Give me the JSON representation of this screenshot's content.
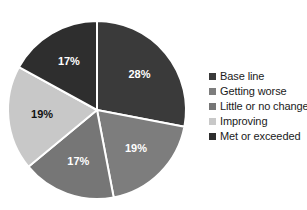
{
  "chart_data": {
    "type": "pie",
    "title": "",
    "subtitle": "",
    "xlabel": "",
    "ylabel": "",
    "legend_position": "right",
    "grid": false,
    "start_angle_deg": 0,
    "direction": "clockwise",
    "categories": [
      "Base line",
      "Getting worse",
      "Little or no change",
      "Improving",
      "Met or exceeded"
    ],
    "values": [
      28,
      19,
      17,
      19,
      17
    ],
    "labels": [
      "28%",
      "19%",
      "17%",
      "19%",
      "17%"
    ],
    "colors": [
      "#3a3a3a",
      "#7d7d7d",
      "#767676",
      "#c8c8c8",
      "#2e2e2e"
    ],
    "label_colors": [
      "#ffffff",
      "#ffffff",
      "#ffffff",
      "#111111",
      "#ffffff"
    ],
    "slices": [
      {
        "name": "Base line",
        "value": 28,
        "label": "28%",
        "color": "#3a3a3a",
        "label_color": "#ffffff"
      },
      {
        "name": "Getting worse",
        "value": 19,
        "label": "19%",
        "color": "#7d7d7d",
        "label_color": "#ffffff"
      },
      {
        "name": "Little or no change",
        "value": 17,
        "label": "17%",
        "color": "#767676",
        "label_color": "#ffffff"
      },
      {
        "name": "Improving",
        "value": 19,
        "label": "19%",
        "color": "#c8c8c8",
        "label_color": "#111111"
      },
      {
        "name": "Met or exceeded",
        "value": 17,
        "label": "17%",
        "color": "#2e2e2e",
        "label_color": "#ffffff"
      }
    ]
  },
  "geometry": {
    "center_x": 97,
    "center_y": 110,
    "radius": 89,
    "separator_color": "#ffffff",
    "separator_width": 2
  },
  "legend": {
    "items": [
      {
        "label": "Base line",
        "color": "#3a3a3a"
      },
      {
        "label": "Getting worse",
        "color": "#7d7d7d"
      },
      {
        "label": "Little or no change",
        "color": "#767676"
      },
      {
        "label": "Improving",
        "color": "#c8c8c8"
      },
      {
        "label": "Met or exceeded",
        "color": "#2e2e2e"
      }
    ]
  },
  "background_color": "#ffffff"
}
